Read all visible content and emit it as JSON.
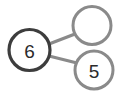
{
  "diagram": {
    "type": "number-bond",
    "background_color": "#ffffff",
    "whole": {
      "label": "6",
      "cx": 29.5,
      "cy": 50,
      "r": 20.5,
      "stroke_color": "#3d3d3d",
      "stroke_width": 3.2,
      "fill_color": "#ffffff",
      "text_color": "#2b2b2b",
      "empty": false
    },
    "parts": [
      {
        "label": "",
        "cx": 92,
        "cy": 25.5,
        "r": 19,
        "stroke_color": "#8a8a8a",
        "stroke_width": 3.0,
        "fill_color": "#ffffff",
        "text_color": "#2b2b2b",
        "empty": true
      },
      {
        "label": "5",
        "cx": 94,
        "cy": 70,
        "r": 19,
        "stroke_color": "#8a8a8a",
        "stroke_width": 3.0,
        "fill_color": "#ffffff",
        "text_color": "#2b2b2b",
        "empty": false
      }
    ],
    "connectors": [
      {
        "name": "whole-to-top-part",
        "x1": 49,
        "y1": 44,
        "x2": 75,
        "y2": 34,
        "color": "#8a8a8a",
        "width": 3.2
      },
      {
        "name": "whole-to-bottom-part",
        "x1": 49,
        "y1": 56,
        "x2": 77,
        "y2": 63,
        "color": "#8a8a8a",
        "width": 3.2
      }
    ]
  }
}
